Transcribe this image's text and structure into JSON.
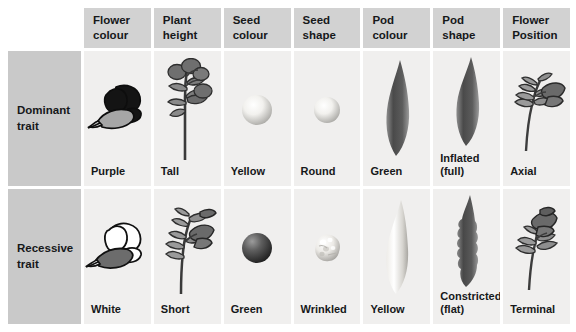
{
  "table": {
    "row_headers": [
      {
        "id": "dominant",
        "line1": "Dominant",
        "line2": "trait"
      },
      {
        "id": "recessive",
        "line1": "Recessive",
        "line2": "trait"
      }
    ],
    "columns": [
      {
        "id": "flower-colour",
        "line1": "Flower",
        "line2": "colour"
      },
      {
        "id": "plant-height",
        "line1": "Plant",
        "line2": "height"
      },
      {
        "id": "seed-colour",
        "line1": "Seed",
        "line2": "colour"
      },
      {
        "id": "seed-shape",
        "line1": "Seed",
        "line2": "shape"
      },
      {
        "id": "pod-colour",
        "line1": "Pod",
        "line2": "colour"
      },
      {
        "id": "pod-shape",
        "line1": "Pod",
        "line2": "shape"
      },
      {
        "id": "flower-position",
        "line1": "Flower",
        "line2": "Position"
      }
    ],
    "dominant": [
      {
        "label": "Purple",
        "sub": ""
      },
      {
        "label": "Tall",
        "sub": ""
      },
      {
        "label": "Yellow",
        "sub": ""
      },
      {
        "label": "Round",
        "sub": ""
      },
      {
        "label": "Green",
        "sub": ""
      },
      {
        "label": "Inflated",
        "sub": "(full)"
      },
      {
        "label": "Axial",
        "sub": ""
      }
    ],
    "recessive": [
      {
        "label": "White",
        "sub": ""
      },
      {
        "label": "Short",
        "sub": ""
      },
      {
        "label": "Green",
        "sub": ""
      },
      {
        "label": "Wrinkled",
        "sub": ""
      },
      {
        "label": "Yellow",
        "sub": ""
      },
      {
        "label": "Constricted",
        "sub": "(flat)"
      },
      {
        "label": "Terminal",
        "sub": ""
      }
    ]
  },
  "colors": {
    "header_grey": "#d2d2d2",
    "rowhead_grey": "#c9c9c9",
    "cell_bg": "#f0efee",
    "page_bg": "#ffffff",
    "ink": "#16181a",
    "art_dark": "#333333",
    "art_mid": "#6e6e6e",
    "art_light": "#b4b4b4"
  }
}
